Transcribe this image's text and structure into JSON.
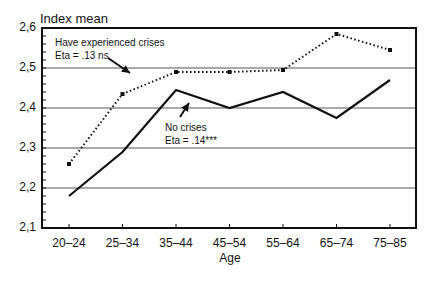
{
  "chart_data": {
    "type": "line",
    "title": "",
    "ylabel": "Index mean",
    "xlabel": "Age",
    "categories": [
      "20–24",
      "25–34",
      "35–44",
      "45–54",
      "55–64",
      "65–74",
      "75–85"
    ],
    "ylim": [
      2.1,
      2.6
    ],
    "yticks": [
      "2,1",
      "2,2",
      "2,3",
      "2,4",
      "2,5",
      "2,6"
    ],
    "grid": true,
    "series": [
      {
        "name": "Have experienced crises",
        "annotation": "Eta = .13 ns",
        "style": "dotted",
        "values": [
          2.26,
          2.435,
          2.49,
          2.49,
          2.495,
          2.585,
          2.545
        ]
      },
      {
        "name": "No crises",
        "annotation": "Eta = .14***",
        "style": "solid",
        "values": [
          2.18,
          2.29,
          2.445,
          2.4,
          2.44,
          2.375,
          2.47
        ]
      }
    ],
    "annotations": [
      {
        "text": "Have experienced crises",
        "line2": "Eta = .13 ns"
      },
      {
        "text": "No crises",
        "line2": "Eta = .14***"
      }
    ]
  },
  "labels": {
    "ylabel": "Index mean",
    "xlabel": "Age",
    "series1_name": "Have experienced crises",
    "series1_eta": "Eta = .13 ns",
    "series2_name": "No crises",
    "series2_eta": "Eta = .14***"
  }
}
